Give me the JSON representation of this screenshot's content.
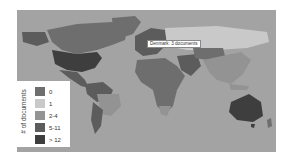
{
  "tooltip": {
    "text": "Denmark: 3 documents"
  },
  "legend": {
    "title": "# of documents",
    "items": [
      {
        "label": "0",
        "color": "#6e6e6e"
      },
      {
        "label": "1",
        "color": "#c9c9c9"
      },
      {
        "label": "2-4",
        "color": "#939393"
      },
      {
        "label": "5-11",
        "color": "#5c5c5c"
      },
      {
        "label": "> 12",
        "color": "#3e3e3e"
      }
    ]
  },
  "colors": {
    "ocean": "#a3a3a3",
    "background": "#ffffff"
  },
  "regions": [
    {
      "name": "Alaska/Western Canada",
      "bin": "5-11"
    },
    {
      "name": "Canada",
      "bin": "0"
    },
    {
      "name": "Greenland",
      "bin": "0"
    },
    {
      "name": "United States",
      "bin": "> 12"
    },
    {
      "name": "Mexico",
      "bin": "5-11"
    },
    {
      "name": "South America (north)",
      "bin": "5-11"
    },
    {
      "name": "Brazil",
      "bin": "2-4"
    },
    {
      "name": "Argentina/Chile",
      "bin": "5-11"
    },
    {
      "name": "Africa",
      "bin": "0"
    },
    {
      "name": "South Africa",
      "bin": "2-4"
    },
    {
      "name": "Europe",
      "bin": "5-11"
    },
    {
      "name": "Russia",
      "bin": "1"
    },
    {
      "name": "Middle East",
      "bin": "5-11"
    },
    {
      "name": "Central Asia",
      "bin": "0"
    },
    {
      "name": "India/China",
      "bin": "2-4"
    },
    {
      "name": "Australia",
      "bin": "> 12"
    }
  ]
}
